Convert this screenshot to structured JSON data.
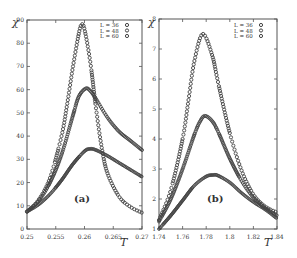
{
  "chart_data": [
    {
      "type": "scatter",
      "panel_label": "(a)",
      "title": "",
      "xlabel": "T",
      "ylabel": "χ",
      "xlim": [
        0.25,
        0.27
      ],
      "ylim": [
        0,
        90
      ],
      "xticks": [
        0.25,
        0.255,
        0.26,
        0.265,
        0.27
      ],
      "xtick_labels": [
        "0.25",
        "0.255",
        "0.26",
        "0.265",
        "0.27"
      ],
      "yticks": [
        0,
        10,
        20,
        30,
        40,
        50,
        60,
        70,
        80,
        90
      ],
      "ytick_labels": [
        "0",
        "10",
        "20",
        "30",
        "40",
        "50",
        "60",
        "70",
        "80",
        "90"
      ],
      "grid": false,
      "legend_position": "upper right",
      "series": [
        {
          "name": "L = 36",
          "peak": [
            0.261,
            34.5
          ],
          "x": [
            0.25,
            0.252,
            0.254,
            0.256,
            0.258,
            0.26,
            0.261,
            0.262,
            0.264,
            0.266,
            0.268,
            0.27
          ],
          "y": [
            7.5,
            10.5,
            15,
            21,
            28,
            33.5,
            34.5,
            34,
            31.5,
            28.5,
            25.5,
            22.5
          ]
        },
        {
          "name": "L = 48",
          "peak": [
            0.2602,
            60.5
          ],
          "x": [
            0.25,
            0.252,
            0.254,
            0.256,
            0.258,
            0.259,
            0.2602,
            0.261,
            0.262,
            0.264,
            0.266,
            0.268,
            0.27
          ],
          "y": [
            7.5,
            12,
            20,
            32,
            49,
            57,
            60.5,
            59.5,
            56,
            48,
            42,
            38,
            34
          ]
        },
        {
          "name": "L = 60",
          "peak": [
            0.2595,
            88
          ],
          "x": [
            0.25,
            0.252,
            0.254,
            0.256,
            0.257,
            0.258,
            0.259,
            0.2595,
            0.26,
            0.261,
            0.262,
            0.263,
            0.264,
            0.266,
            0.268,
            0.27
          ],
          "y": [
            7.5,
            12.5,
            22,
            40,
            54,
            70,
            84,
            88,
            86,
            72,
            52,
            35,
            24,
            14,
            9.5,
            7
          ]
        }
      ]
    },
    {
      "type": "scatter",
      "panel_label": "(b)",
      "title": "",
      "xlabel": "T",
      "ylabel": "χ",
      "xlim": [
        1.74,
        1.84
      ],
      "ylim": [
        1,
        8
      ],
      "xticks": [
        1.74,
        1.76,
        1.78,
        1.8,
        1.82,
        1.84
      ],
      "xtick_labels": [
        "1.74",
        "1.76",
        "1.78",
        "1.8",
        "1.82",
        "1.84"
      ],
      "yticks": [
        1,
        2,
        3,
        4,
        5,
        6,
        7,
        8
      ],
      "ytick_labels": [
        "1",
        "2",
        "3",
        "4",
        "5",
        "6",
        "7",
        "8"
      ],
      "grid": false,
      "legend_position": "upper right",
      "series": [
        {
          "name": "L = 36",
          "peak": [
            1.786,
            2.8
          ],
          "x": [
            1.74,
            1.75,
            1.76,
            1.77,
            1.78,
            1.786,
            1.79,
            1.8,
            1.81,
            1.82,
            1.83,
            1.84
          ],
          "y": [
            1.0,
            1.45,
            1.95,
            2.45,
            2.75,
            2.8,
            2.78,
            2.55,
            2.2,
            1.9,
            1.65,
            1.35
          ]
        },
        {
          "name": "L = 48",
          "peak": [
            1.779,
            4.77
          ],
          "x": [
            1.74,
            1.75,
            1.76,
            1.77,
            1.775,
            1.779,
            1.785,
            1.79,
            1.8,
            1.81,
            1.82,
            1.83,
            1.84
          ],
          "y": [
            1.25,
            2.0,
            3.0,
            4.15,
            4.6,
            4.77,
            4.6,
            4.25,
            3.35,
            2.6,
            2.05,
            1.7,
            1.45
          ]
        },
        {
          "name": "L = 60",
          "peak": [
            1.777,
            7.5
          ],
          "x": [
            1.74,
            1.75,
            1.76,
            1.765,
            1.77,
            1.777,
            1.785,
            1.79,
            1.8,
            1.81,
            1.82,
            1.83,
            1.84
          ],
          "y": [
            1.3,
            2.3,
            4.0,
            5.3,
            6.6,
            7.5,
            6.8,
            5.9,
            4.2,
            2.95,
            2.15,
            1.75,
            1.55
          ]
        }
      ]
    }
  ]
}
